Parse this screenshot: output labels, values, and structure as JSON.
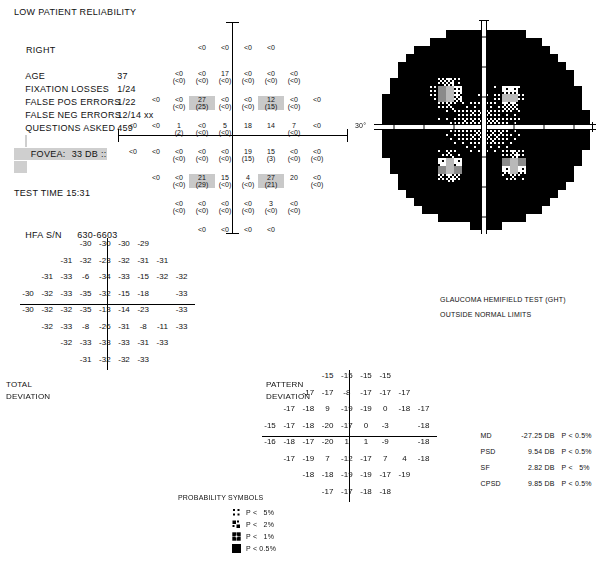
{
  "report": {
    "reliability_warning": "LOW PATIENT RELIABILITY",
    "eye": "RIGHT",
    "fields": [
      {
        "label": "AGE",
        "value": "37",
        "highlight": false
      },
      {
        "label": "FIXATION LOSSES",
        "value": "1/24",
        "highlight": false
      },
      {
        "label": "FALSE POS ERRORS",
        "value": "1/22",
        "highlight": false
      },
      {
        "label": "FALSE NEG ERRORS",
        "value": "12/14 xx",
        "highlight": false
      },
      {
        "label": "QUESTIONS ASKED",
        "value": "459",
        "highlight": false
      },
      {
        "label": "FOVEA:",
        "value": "33 DB ::",
        "highlight": true
      },
      {
        "label": "TEST TIME 15:31",
        "value": "",
        "highlight": false
      }
    ],
    "serial_label": "HFA S/N",
    "serial_value": "630-6603"
  },
  "grayscale": {
    "degree_label": "30°"
  },
  "ght": {
    "title": "GLAUCOMA HEMIFIELD TEST (GHT)",
    "result": "OUTSIDE NORMAL LIMITS"
  },
  "total_deviation": {
    "title_line1": "TOTAL",
    "title_line2": "DEVIATION"
  },
  "pattern_deviation": {
    "title_line1": "PATTERN",
    "title_line2": "DEVIATION"
  },
  "probability_legend": {
    "title": "PROBABILITY SYMBOLS",
    "entries": [
      {
        "symbol": "p5",
        "text": "P <   5%"
      },
      {
        "symbol": "p2",
        "text": "P <   2%"
      },
      {
        "symbol": "p1",
        "text": "P <   1%"
      },
      {
        "symbol": "p05",
        "text": "P < 0.5%"
      }
    ]
  },
  "global_indices": [
    {
      "name": "MD",
      "value": "-27.25 DB",
      "prob": "P < 0.5%"
    },
    {
      "name": "PSD",
      "value": "9.54 DB",
      "prob": "P < 0.5%"
    },
    {
      "name": "SF",
      "value": "2.82 DB",
      "prob": "P <   5%"
    },
    {
      "name": "CPSD",
      "value": "9.85 DB",
      "prob": "P < 0.5%"
    }
  ],
  "chart_data": {
    "type": "table",
    "threshold_grid": {
      "note": "Sensitivity in dB per test point; value in parentheses is the retest value. '<0' means below 0 dB.",
      "rows": [
        [
          null,
          null,
          null,
          "<0",
          "<0",
          "<0",
          "<0",
          null,
          null,
          null
        ],
        [
          null,
          null,
          "<0/<0",
          "<0/<0",
          "17/<0",
          "<0/<0",
          "<0/<0",
          "<0/<0",
          null,
          null
        ],
        [
          null,
          "<0",
          "<0/<0",
          "27/25",
          "<0/<0",
          "<0/<0",
          "12/15",
          "<0/<0",
          "<0",
          null
        ],
        [
          "<0",
          "<0",
          "1/2",
          "<0/<0",
          "5/<0",
          "18",
          "14",
          "7/<0",
          "<0",
          null
        ],
        [
          "<0",
          "<0",
          "<0/(<0)",
          "<0/(<0)",
          "<0/(<0)",
          "19/(15)",
          "15/(3)",
          "<0/<0",
          "<0/(<0)",
          null
        ],
        [
          null,
          "<0",
          "<0/<0",
          "21/29",
          "15/<0",
          "4/<0",
          "27/21",
          "20",
          "<0/<0",
          null
        ],
        [
          null,
          null,
          "<0/<0",
          "<0/<0",
          "<0/<0",
          "<0/<0",
          "3/<0",
          "<0/<0",
          null,
          null
        ],
        [
          null,
          null,
          null,
          "<0",
          "<0",
          "<0",
          "<0",
          null,
          null,
          null
        ]
      ]
    },
    "total_deviation_values": [
      [
        null,
        null,
        null,
        "-30",
        "-30",
        "-30",
        "-29",
        null,
        null,
        null
      ],
      [
        null,
        null,
        "-31",
        "-32",
        "-23",
        "-32",
        "-31",
        "-31",
        null,
        null
      ],
      [
        null,
        "-31",
        "-33",
        "-6",
        "-34",
        "-33",
        "-15",
        "-32",
        "-32",
        null
      ],
      [
        "-30",
        "-32",
        "-33",
        "-35",
        "-32",
        "-15",
        "-18",
        null,
        "-33",
        null
      ],
      [
        "-30",
        "-32",
        "-32",
        "-35",
        "-13",
        "-14",
        "-23",
        null,
        "-33",
        null
      ],
      [
        null,
        "-32",
        "-33",
        "-8",
        "-26",
        "-31",
        "-8",
        "-11",
        "-33",
        null
      ],
      [
        null,
        null,
        "-32",
        "-33",
        "-33",
        "-33",
        "-31",
        "-33",
        null,
        null
      ],
      [
        null,
        null,
        null,
        "-31",
        "-32",
        "-32",
        "-33",
        null,
        null,
        null
      ]
    ],
    "pattern_deviation_values": [
      [
        null,
        null,
        null,
        "-15",
        "-15",
        "-15",
        "-15",
        null,
        null,
        null
      ],
      [
        null,
        null,
        "-17",
        "-17",
        "-8",
        "-17",
        "-17",
        "-17",
        null,
        null
      ],
      [
        null,
        "-17",
        "-18",
        "9",
        "-19",
        "-19",
        "0",
        "-18",
        "-17",
        null
      ],
      [
        "-15",
        "-17",
        "-18",
        "-20",
        "-17",
        "0",
        "-3",
        null,
        "-18",
        null
      ],
      [
        "-16",
        "-18",
        "-17",
        "-20",
        "1",
        "1",
        "-9",
        null,
        "-18",
        null
      ],
      [
        null,
        "-17",
        "-19",
        "7",
        "-12",
        "-17",
        "7",
        "4",
        "-18",
        null
      ],
      [
        null,
        null,
        "-18",
        "-18",
        "-19",
        "-19",
        "-17",
        "-19",
        null,
        null
      ],
      [
        null,
        null,
        null,
        "-17",
        "-17",
        "-18",
        "-18",
        null,
        null,
        null
      ]
    ],
    "total_deviation_symbols": [
      [
        null,
        null,
        null,
        "p05",
        "p05",
        "p05",
        "p1",
        null,
        null,
        null
      ],
      [
        null,
        null,
        "p05",
        "p05",
        "p05",
        "p05",
        "p05",
        "p05",
        null,
        null
      ],
      [
        null,
        "p05",
        "p05",
        "p5",
        "p05",
        "p05",
        "p05",
        "p05",
        "p05",
        null
      ],
      [
        "p05",
        "p05",
        "p05",
        "p05",
        "p05",
        "p05",
        "p05",
        null,
        "p05",
        null
      ],
      [
        "p05",
        "p05",
        "p05",
        "p05",
        "p05",
        "p05",
        "p05",
        null,
        "p05",
        null
      ],
      [
        null,
        "p05",
        "p05",
        "p05",
        "p05",
        "p05",
        "p05",
        "p05",
        "p05",
        null
      ],
      [
        null,
        null,
        "p05",
        "p05",
        "p05",
        "p05",
        "p05",
        "p05",
        null,
        null
      ],
      [
        null,
        null,
        null,
        "p05",
        "p05",
        "p05",
        "p05",
        null,
        null,
        null
      ]
    ],
    "pattern_deviation_symbols": [
      [
        null,
        null,
        null,
        "p1",
        "p1",
        "p1",
        "p2",
        null,
        null,
        null
      ],
      [
        null,
        null,
        "p05",
        "p05",
        "p2",
        "p05",
        "p05",
        "p05",
        null,
        null
      ],
      [
        null,
        "p05",
        "p05",
        "norm",
        "p05",
        "p05",
        "norm",
        "p05",
        "p05",
        null
      ],
      [
        "p1",
        "p05",
        "p05",
        "p05",
        "p05",
        "norm",
        "norm",
        null,
        "p05",
        null
      ],
      [
        "p05",
        "p05",
        "p05",
        "p05",
        "norm",
        "norm",
        "p05",
        null,
        "p05",
        null
      ],
      [
        null,
        "p05",
        "p05",
        "norm",
        "p05",
        "p05",
        "norm",
        "norm",
        "p05",
        null
      ],
      [
        null,
        null,
        "p05",
        "p05",
        "p05",
        "p05",
        "p05",
        "p05",
        null,
        null
      ],
      [
        null,
        null,
        null,
        "p05",
        "p05",
        "p05",
        "p05",
        null,
        null,
        null
      ]
    ]
  }
}
